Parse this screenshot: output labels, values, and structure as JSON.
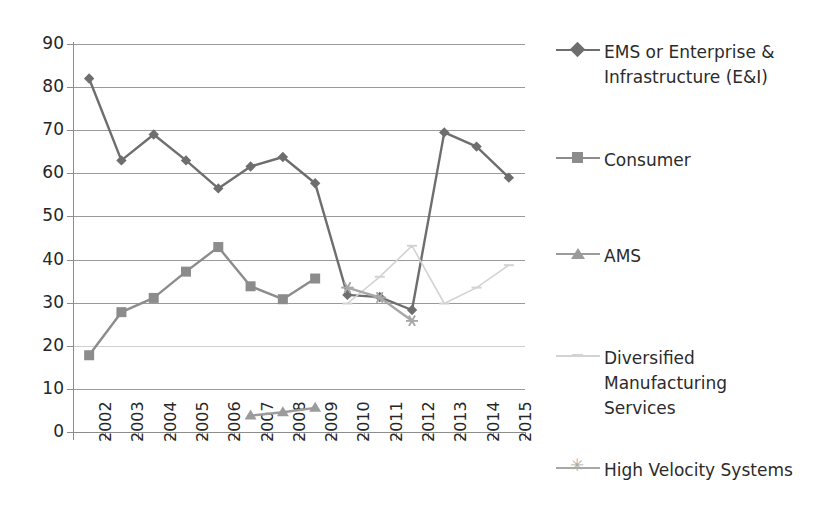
{
  "chart_data": {
    "type": "line",
    "title": "",
    "xlabel": "",
    "ylabel": "",
    "ylim": [
      0,
      90
    ],
    "ytick_step": 10,
    "grid": true,
    "legend_position": "right",
    "categories": [
      "2002",
      "2003",
      "2004",
      "2005",
      "2006",
      "2007",
      "2008",
      "2009",
      "2010",
      "2011",
      "2012",
      "2013",
      "2014",
      "2015"
    ],
    "ytick_labels": [
      "90",
      "80",
      "70",
      "60",
      "50",
      "40",
      "30",
      "20",
      "10",
      "0"
    ],
    "series": [
      {
        "name": "EMS or Enterprise & Infrastructure (E&I)",
        "legend_label": "EMS or Enterprise &\nInfrastructure (E&I)",
        "marker": "diamond",
        "color": "#6e6e6e",
        "values": [
          82.0,
          63.0,
          69.0,
          63.0,
          56.5,
          61.6,
          63.8,
          57.7,
          31.8,
          31.3,
          28.3,
          69.5,
          66.2,
          59.0
        ]
      },
      {
        "name": "Consumer",
        "legend_label": "Consumer",
        "marker": "square",
        "color": "#8c8c8c",
        "values": [
          17.8,
          27.8,
          31.1,
          37.2,
          42.9,
          33.8,
          30.8,
          35.6,
          null,
          null,
          null,
          null,
          null,
          null
        ]
      },
      {
        "name": "AMS",
        "legend_label": "AMS",
        "marker": "triangle",
        "color": "#9b9b9b",
        "values": [
          null,
          null,
          null,
          null,
          null,
          3.8,
          4.6,
          5.6,
          null,
          null,
          null,
          null,
          null,
          null
        ]
      },
      {
        "name": "Diversified Manufacturing Services",
        "legend_label": "Diversified\nManufacturing\nServices",
        "marker": "dash",
        "color": "#d3d3d3",
        "values": [
          null,
          null,
          null,
          null,
          null,
          null,
          null,
          null,
          29.8,
          36.0,
          43.2,
          29.8,
          33.5,
          38.7
        ]
      },
      {
        "name": "High Velocity Systems",
        "legend_label": "High Velocity Systems",
        "marker": "star",
        "color": "#a8a8a8",
        "values": [
          null,
          null,
          null,
          null,
          null,
          null,
          null,
          null,
          33.5,
          31.2,
          25.8,
          null,
          null,
          null
        ]
      }
    ]
  },
  "legend": {
    "items": [
      {
        "label": "EMS or Enterprise &\nInfrastructure (E&I)",
        "marker": "diamond",
        "color": "#6e6e6e"
      },
      {
        "label": "Consumer",
        "marker": "square",
        "color": "#8c8c8c"
      },
      {
        "label": "AMS",
        "marker": "triangle",
        "color": "#9b9b9b"
      },
      {
        "label": "Diversified\nManufacturing\nServices",
        "marker": "dash",
        "color": "#d3d3d3"
      },
      {
        "label": "High Velocity Systems",
        "marker": "star",
        "color": "#a8a8a8"
      }
    ]
  }
}
